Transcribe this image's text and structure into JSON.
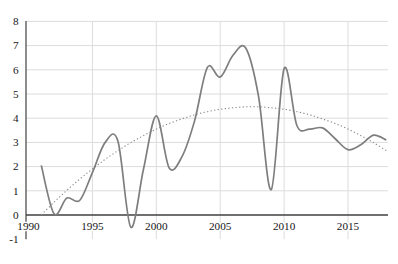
{
  "chart_data": {
    "type": "line",
    "title": "",
    "xlabel": "",
    "ylabel": "",
    "x": [
      1991,
      1992,
      1993,
      1994,
      1995,
      1996,
      1997,
      1998,
      1999,
      2000,
      2001,
      2002,
      2003,
      2004,
      2005,
      2006,
      2007,
      2008,
      2009,
      2010,
      2011,
      2012,
      2013,
      2014,
      2015,
      2016,
      2017,
      2018
    ],
    "series": [
      {
        "name": "actual-series",
        "line_style": "solid",
        "color": "#7e7e7e",
        "width": 1.7,
        "values": [
          2.05,
          0.05,
          0.7,
          0.6,
          1.75,
          3.0,
          3.05,
          -0.5,
          1.9,
          4.1,
          1.95,
          2.4,
          3.9,
          6.1,
          5.7,
          6.6,
          6.9,
          4.9,
          1.05,
          6.05,
          3.7,
          3.55,
          3.6,
          3.15,
          2.7,
          2.9,
          3.3,
          3.1
        ]
      },
      {
        "name": "polynomial-trendline",
        "line_style": "dotted",
        "color": "#8a8a8a",
        "width": 1.1,
        "values": [
          0.0,
          0.53,
          1.02,
          1.48,
          1.9,
          2.3,
          2.66,
          2.99,
          3.28,
          3.55,
          3.78,
          3.97,
          4.14,
          4.27,
          4.37,
          4.43,
          4.47,
          4.47,
          4.43,
          4.37,
          4.27,
          4.14,
          3.97,
          3.78,
          3.55,
          3.28,
          2.99,
          2.66
        ]
      }
    ],
    "x_tick_years": [
      1990,
      1995,
      2000,
      2005,
      2010,
      2015
    ],
    "x_tick_labels": [
      "1990",
      "1995",
      "2000",
      "2005",
      "2010",
      "2015"
    ],
    "y_tick_values": [
      8,
      7,
      6,
      5,
      4,
      3,
      2,
      1,
      0,
      -1
    ],
    "y_tick_labels": [
      "8",
      "7",
      "6",
      "5",
      "4",
      "3",
      "2",
      "1",
      "0",
      "-1"
    ],
    "xlim": [
      1990,
      2018.2
    ],
    "ylim": [
      -1,
      8
    ],
    "grid": true,
    "legend": false,
    "colors": {
      "grid": "#dcdcdc",
      "axis": "#404040",
      "text": "#161616",
      "background": "#ffffff"
    }
  }
}
